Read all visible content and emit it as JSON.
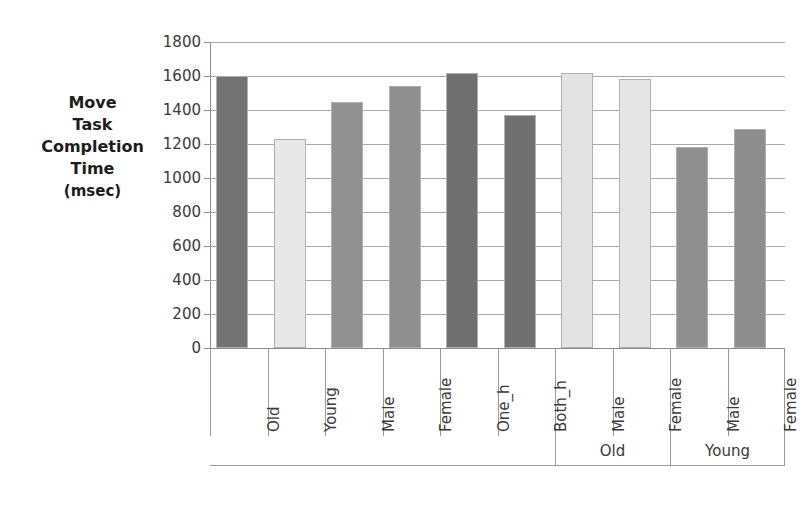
{
  "chart_data": {
    "type": "bar",
    "title": "",
    "xlabel": "",
    "ylabel": "Move Task Completion Time (msec)",
    "ylim": [
      0,
      1800
    ],
    "grid": true,
    "legend": "none",
    "categories": [
      "Old",
      "Young",
      "Male",
      "Female",
      "One_h",
      "Both_h",
      "Male",
      "Female",
      "Male",
      "Female"
    ],
    "values": [
      1600,
      1230,
      1450,
      1540,
      1620,
      1370,
      1615,
      1580,
      1185,
      1290
    ],
    "bar_colors": [
      "#737373",
      "#e8e8e8",
      "#919191",
      "#8f8f8f",
      "#6f6f6f",
      "#707070",
      "#e3e3e3",
      "#e5e5e5",
      "#8f8f8f",
      "#8d8d8d"
    ],
    "y_ticks": [
      0,
      200,
      400,
      600,
      800,
      1000,
      1200,
      1400,
      1600,
      1800
    ],
    "y_tick_labels": [
      "0",
      "200",
      "400",
      "600",
      "800",
      "1000",
      "1200",
      "1400",
      "1600",
      "1800"
    ],
    "groups": [
      {
        "label": "",
        "start": 0,
        "end": 5
      },
      {
        "label": "Old",
        "start": 6,
        "end": 7
      },
      {
        "label": "Young",
        "start": 8,
        "end": 9
      }
    ]
  },
  "axis": {
    "y_title_line1": "Move",
    "y_title_line2": "Task",
    "y_title_line3": "Completion",
    "y_title_line4": "Time",
    "y_title_unit": "(msec)"
  },
  "groups": {
    "old_label": "Old",
    "young_label": "Young"
  }
}
